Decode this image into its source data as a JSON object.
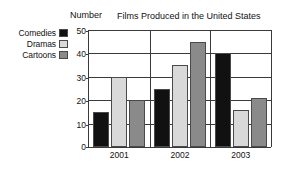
{
  "chart_data": {
    "type": "bar",
    "title": "Films Produced in the United States",
    "xlabel": "",
    "ylabel": "Number",
    "categories": [
      "2001",
      "2002",
      "2003"
    ],
    "series": [
      {
        "name": "Comedies",
        "color": "#111111",
        "values": [
          15,
          25,
          40
        ]
      },
      {
        "name": "Dramas",
        "color": "#d9d9d9",
        "values": [
          30,
          35,
          16
        ]
      },
      {
        "name": "Cartoons",
        "color": "#8a8a8a",
        "values": [
          20,
          45,
          21
        ]
      }
    ],
    "ylim": [
      0,
      50
    ],
    "yticks": [
      0,
      10,
      20,
      30,
      40,
      50
    ],
    "grid": true,
    "legend_position": "left-outside"
  },
  "legend": {
    "items": [
      {
        "label": "Comedies",
        "color": "#111111"
      },
      {
        "label": "Dramas",
        "color": "#d9d9d9"
      },
      {
        "label": "Cartoons",
        "color": "#8a8a8a"
      }
    ]
  },
  "axis": {
    "y_title": "Number",
    "y_ticks": [
      "50",
      "40",
      "30",
      "20",
      "10",
      "0"
    ],
    "x_ticks": [
      "2001",
      "2002",
      "2003"
    ]
  },
  "title": "Films Produced in the United States"
}
